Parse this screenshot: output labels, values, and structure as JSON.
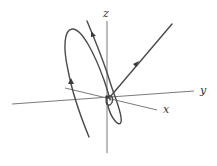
{
  "figure": {
    "type": "3d-trajectory-diagram",
    "axes": {
      "x": {
        "label": "x"
      },
      "y": {
        "label": "y"
      },
      "z": {
        "label": "z"
      }
    },
    "colors": {
      "axis": "#7a7a7a",
      "curve": "#4a4a4a",
      "background": "#ffffff"
    },
    "curves": [
      {
        "name": "outer-spiral-loop",
        "direction_arrows": 1
      },
      {
        "name": "inner-spiral-curve",
        "direction_arrows": 1
      },
      {
        "name": "straight-outgoing-ray",
        "direction_arrows": 1
      }
    ]
  }
}
